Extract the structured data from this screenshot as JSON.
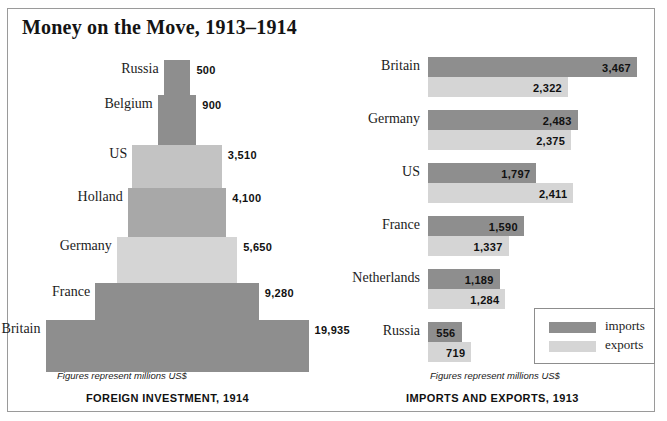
{
  "title": "Money on the Move, 1913–1914",
  "colors": {
    "dark": "#8e8e8e",
    "mid": "#a8a8a8",
    "light": "#c3c3c3",
    "lightest": "#d5d5d5",
    "text": "#1c1c1c",
    "frame": "#9a9a9a"
  },
  "left_panel": {
    "caption": "FOREIGN INVESTMENT, 1914",
    "note": "Figures represent millions US$"
  },
  "right_panel": {
    "caption": "IMPORTS AND EXPORTS, 1913",
    "note": "Figures represent millions US$",
    "legend": {
      "imports_label": "imports",
      "exports_label": "exports"
    }
  },
  "chart_data": [
    {
      "type": "bar",
      "title": "FOREIGN INVESTMENT, 1914",
      "subtitle": "Figures represent millions US$",
      "orientation": "pyramid",
      "xlabel": "",
      "ylabel": "millions US$",
      "categories": [
        "Russia",
        "Belgium",
        "US",
        "Holland",
        "Germany",
        "France",
        "Britain"
      ],
      "values": [
        500,
        900,
        3510,
        4100,
        5650,
        9280,
        19935
      ],
      "labels": [
        "500",
        "900",
        "3,510",
        "4,100",
        "5,650",
        "9,280",
        "19,935"
      ],
      "max": 19935
    },
    {
      "type": "bar",
      "title": "IMPORTS AND EXPORTS, 1913",
      "subtitle": "Figures represent millions US$",
      "orientation": "horizontal",
      "xlabel": "millions US$",
      "ylabel": "",
      "categories": [
        "Britain",
        "Germany",
        "US",
        "France",
        "Netherlands",
        "Russia"
      ],
      "legend_position": "bottom-right",
      "series": [
        {
          "name": "imports",
          "values": [
            3467,
            2483,
            1797,
            1590,
            1189,
            556
          ],
          "labels": [
            "3,467",
            "2,483",
            "1,797",
            "1,590",
            "1,189",
            "556"
          ]
        },
        {
          "name": "exports",
          "values": [
            2322,
            2375,
            2411,
            1337,
            1284,
            719
          ],
          "labels": [
            "2,322",
            "2,375",
            "2,411",
            "1,337",
            "1,284",
            "719"
          ]
        }
      ],
      "max": 3467
    }
  ]
}
